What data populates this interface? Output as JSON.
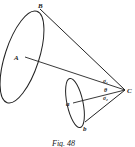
{
  "figure": {
    "caption": "Fig. 48",
    "labels": {
      "B": "B",
      "A": "A",
      "a": "a",
      "b": "b",
      "C": "C",
      "sigma1": "σ₁",
      "theta": "θ",
      "sigma2": "σ₂"
    },
    "colors": {
      "ink": "#222222",
      "background": "#ffffff"
    }
  }
}
